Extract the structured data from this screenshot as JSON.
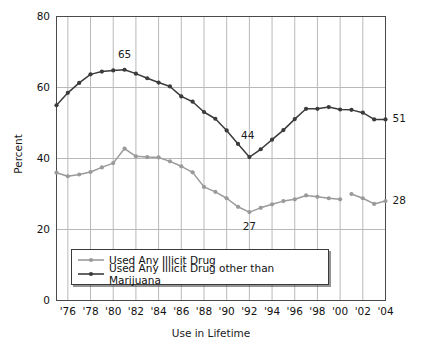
{
  "chart_data": {
    "type": "line",
    "title": "",
    "xlabel": "Use in Lifetime",
    "ylabel": "Percent",
    "ylim": [
      0,
      80
    ],
    "yticks": [
      0,
      20,
      40,
      60,
      80
    ],
    "xlim": [
      1975,
      2004
    ],
    "xticks": [
      1976,
      1978,
      1980,
      1982,
      1984,
      1986,
      1988,
      1990,
      1992,
      1994,
      1996,
      1998,
      2000,
      2002,
      2004
    ],
    "xtick_labels": [
      "'76",
      "'78",
      "'80",
      "'82",
      "'84",
      "'86",
      "'88",
      "'90",
      "'92",
      "'94",
      "'96",
      "'98",
      "'00",
      "'02",
      "'04"
    ],
    "grid": "vertical-and-horizontal",
    "legend_position": "lower-center-inside",
    "series": [
      {
        "name": "Used Any Illicit Drug",
        "color": "#9a9a9a",
        "marker": "circle",
        "x": [
          1975,
          1976,
          1977,
          1978,
          1979,
          1980,
          1981,
          1982,
          1983,
          1984,
          1985,
          1986,
          1987,
          1988,
          1989,
          1990,
          1991,
          1992,
          1993,
          1994,
          1995,
          1996,
          1997,
          1998,
          1999,
          2000,
          2001,
          2002,
          2003,
          2004
        ],
        "values": [
          36.0,
          35.0,
          35.5,
          36.2,
          37.5,
          38.7,
          42.8,
          40.6,
          40.4,
          40.3,
          39.2,
          37.8,
          36.1,
          32.0,
          30.6,
          28.8,
          26.4,
          24.9,
          26.1,
          27.1,
          28.0,
          28.5,
          29.6,
          29.2,
          28.8,
          28.5,
          30.0,
          28.8,
          27.2,
          28.0
        ],
        "break_after_x": 2000
      },
      {
        "name": "Used Any Illicit Drug other than Marijuana",
        "color": "#3b3b3b",
        "marker": "circle",
        "x": [
          1975,
          1976,
          1977,
          1978,
          1979,
          1980,
          1981,
          1982,
          1983,
          1984,
          1985,
          1986,
          1987,
          1988,
          1989,
          1990,
          1991,
          1992,
          1993,
          1994,
          1995,
          1996,
          1997,
          1998,
          1999,
          2000,
          2001,
          2002,
          2003,
          2004
        ],
        "values": [
          55.0,
          58.5,
          61.3,
          63.7,
          64.5,
          64.8,
          65.0,
          63.9,
          62.6,
          61.4,
          60.3,
          57.5,
          56.0,
          53.1,
          51.2,
          47.9,
          44.1,
          40.4,
          42.6,
          45.3,
          48.0,
          51.1,
          54.0,
          54.0,
          54.5,
          53.8,
          53.7,
          52.9,
          51.0,
          51.0
        ]
      }
    ],
    "point_annotations": [
      {
        "label": "65",
        "x": 1981,
        "value": 65.0,
        "series": "Used Any Illicit Drug other than Marijuana",
        "position": "above"
      },
      {
        "label": "44",
        "x": 1991,
        "value": 44.1,
        "series": "Used Any Illicit Drug other than Marijuana",
        "position": "right"
      },
      {
        "label": "27",
        "x": 1992,
        "value": 24.9,
        "series": "Used Any Illicit Drug",
        "position": "below"
      }
    ],
    "end_labels": [
      {
        "label": "51",
        "x": 2004,
        "value": 51.0,
        "series": "Used Any Illicit Drug other than Marijuana"
      },
      {
        "label": "28",
        "x": 2004,
        "value": 28.0,
        "series": "Used Any Illicit Drug"
      }
    ]
  },
  "axes": {
    "y_title": "Percent",
    "x_title": "Use in Lifetime"
  },
  "legend": {
    "items": [
      {
        "label": "Used Any Illicit Drug",
        "color": "#9a9a9a"
      },
      {
        "label": "Used Any Illicit Drug other than Marijuana",
        "color": "#3b3b3b"
      }
    ]
  },
  "colors": {
    "series_light": "#9a9a9a",
    "series_dark": "#3b3b3b",
    "grid": "#b9b9b9",
    "axis": "#4a4a4a",
    "background": "#ffffff"
  }
}
